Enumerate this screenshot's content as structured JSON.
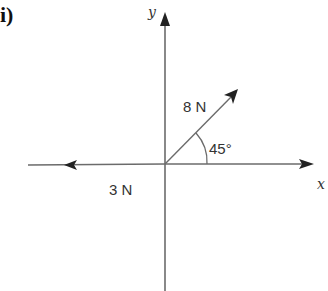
{
  "part_label": "i)",
  "axes": {
    "x_label": "x",
    "y_label": "y"
  },
  "forces": [
    {
      "magnitude_label": "8 N",
      "direction_deg": 45
    },
    {
      "magnitude_label": "3 N",
      "direction_deg": 180
    }
  ],
  "angle_label": "45°",
  "colors": {
    "line": "#6b6b6b",
    "arrow": "#222222",
    "text": "#333333"
  }
}
